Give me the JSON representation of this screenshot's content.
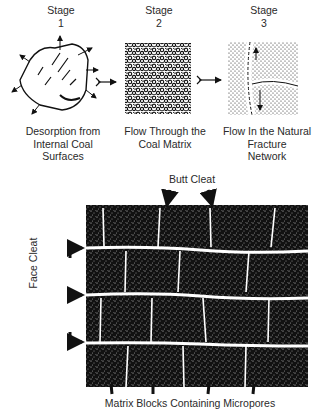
{
  "stages": [
    {
      "title": "Stage",
      "number": "1",
      "caption_lines": [
        "Desorption from",
        "Internal Coal",
        "Surfaces"
      ]
    },
    {
      "title": "Stage",
      "number": "2",
      "caption_lines": [
        "Flow Through the",
        "Coal Matrix"
      ]
    },
    {
      "title": "Stage",
      "number": "3",
      "caption_lines": [
        "Flow In the Natural",
        "Fracture",
        "Network"
      ]
    }
  ],
  "cleat_diagram": {
    "butt_cleat_label": "Butt Cleat",
    "face_cleat_label": "Face Cleat",
    "matrix_label": "Matrix Blocks Containing Micropores"
  },
  "colors": {
    "ink": "#111111",
    "paper": "#ffffff",
    "text": "#2a2a2a"
  }
}
